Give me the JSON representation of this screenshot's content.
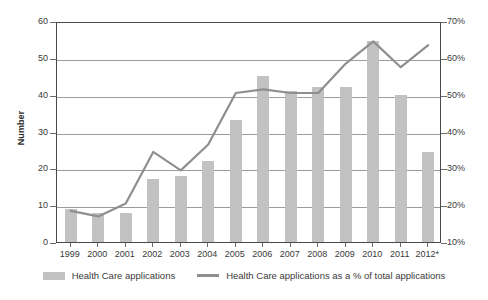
{
  "chart_data": {
    "type": "bar",
    "title": "",
    "subtitle": "",
    "xlabel": "",
    "ylabel": "Number",
    "y2label": "",
    "categories": [
      "1999",
      "2000",
      "2001",
      "2002",
      "2003",
      "2004",
      "2005",
      "2006",
      "2007",
      "2008",
      "2009",
      "2010",
      "2011",
      "2012*"
    ],
    "ylim": [
      0,
      60
    ],
    "yticks": [
      0,
      10,
      20,
      30,
      40,
      50,
      60
    ],
    "ytick_labels": [
      "0",
      "10",
      "20",
      "30",
      "40",
      "50",
      "60"
    ],
    "y2lim": [
      10,
      70
    ],
    "y2ticks": [
      10,
      20,
      30,
      40,
      50,
      60,
      70
    ],
    "y2tick_labels": [
      "10%",
      "20%",
      "30%",
      "40%",
      "50%",
      "60%",
      "70%"
    ],
    "grid": true,
    "legend_position": "bottom",
    "series": [
      {
        "name": "Health Care applications",
        "type": "bar",
        "axis": "left",
        "color": "#c2c2c2",
        "values": [
          9,
          8,
          8,
          17,
          18,
          22,
          33,
          45,
          41,
          42,
          42,
          54.5,
          40,
          24.5
        ]
      },
      {
        "name": "Health Care applications as a % of total applications",
        "type": "line",
        "axis": "right",
        "color": "#8f8f8f",
        "values": [
          19,
          17.5,
          21,
          35,
          30,
          37,
          51,
          52,
          51,
          51,
          59,
          65,
          58,
          64
        ]
      }
    ]
  },
  "legend": {
    "items": [
      {
        "label": "Health Care applications",
        "marker": "bar-swatch-icon"
      },
      {
        "label": "Health Care applications as a % of total applications",
        "marker": "line-swatch-icon"
      }
    ]
  }
}
